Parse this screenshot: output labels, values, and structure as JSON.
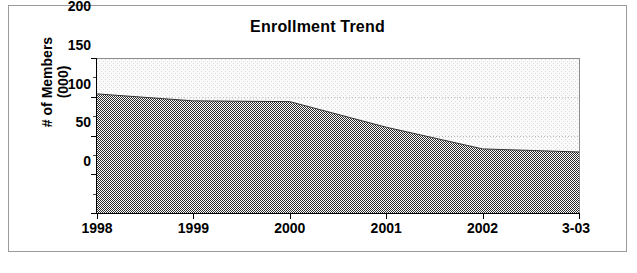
{
  "chart_data": {
    "type": "area",
    "title": "Enrollment Trend",
    "xlabel": "",
    "ylabel_line1": "# of Members",
    "ylabel_line2": "(000)",
    "categories": [
      "1998",
      "1999",
      "2000",
      "2001",
      "2002",
      "3-03"
    ],
    "values": [
      155,
      146,
      145,
      112,
      84,
      80
    ],
    "series": [
      {
        "name": "Enrollment",
        "values": [
          155,
          146,
          145,
          112,
          84,
          80
        ]
      }
    ],
    "ylim": [
      0,
      200
    ],
    "y_ticks": [
      0,
      50,
      100,
      150,
      200
    ],
    "y_tick_labels": [
      "0",
      "50",
      "100",
      "150",
      "200"
    ],
    "x_tick_labels": [
      "1998",
      "1999",
      "2000",
      "2001",
      "2002",
      "3-03"
    ],
    "grid": true,
    "grid_style": "dotted-horizontal",
    "legend": false,
    "legend_position": "none",
    "fill_color": "#6b6b6b",
    "plot_background": "#f1f1f1",
    "axis_color": "#000000",
    "gridline_color": "#b0b0b0",
    "frame_border_color": "#9a9a9a"
  }
}
